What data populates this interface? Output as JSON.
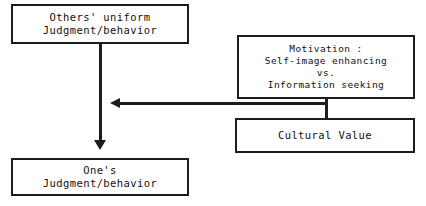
{
  "diagram": {
    "background_color": "#ffffff",
    "stroke_color": "#1d1d1d",
    "nodes": {
      "others": {
        "name": "Others' uniform Judgment/behavior",
        "lines": [
          "Others' uniform",
          "Judgment/behavior"
        ]
      },
      "motivation": {
        "name": "Motivation",
        "lines": [
          "Motivation :",
          "Self-image enhancing",
          "vs.",
          "Information seeking"
        ]
      },
      "cultural": {
        "name": "Cultural Value",
        "lines": [
          "Cultural Value"
        ]
      },
      "ones": {
        "name": "One's Judgment/behavior",
        "lines": [
          "One's",
          "Judgment/behavior"
        ]
      }
    },
    "connectors": {
      "others_to_ones": "vertical-arrow-down",
      "motivation_to_flow": "horizontal-arrow-left",
      "motivation_to_cultural": "vertical-connector"
    }
  }
}
